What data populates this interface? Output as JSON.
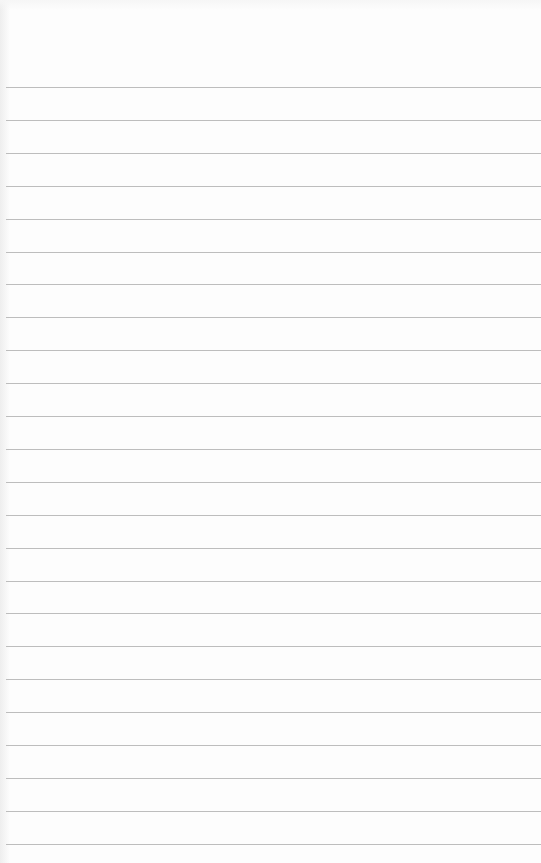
{
  "page": {
    "type": "lined-notepad",
    "background_color": "#fdfdfd",
    "rule_color": "#bdbdbd",
    "first_rule_y": 87,
    "rule_spacing": 32.9,
    "rule_count": 24
  }
}
